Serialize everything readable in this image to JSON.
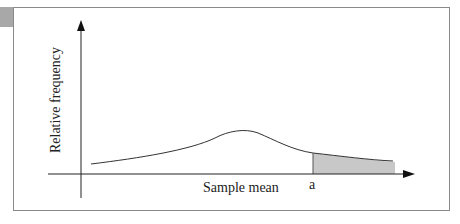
{
  "diagram": {
    "type": "sampling-distribution",
    "y_axis_label": "Relative frequency",
    "x_axis_label": "Sample mean",
    "marker_label": "a",
    "shaded_region": "right tail beyond a",
    "colors": {
      "frame": "#8a8a8a",
      "curve": "#333333",
      "shade": "#c8c8c8",
      "tab": "#a8a8a8"
    }
  }
}
